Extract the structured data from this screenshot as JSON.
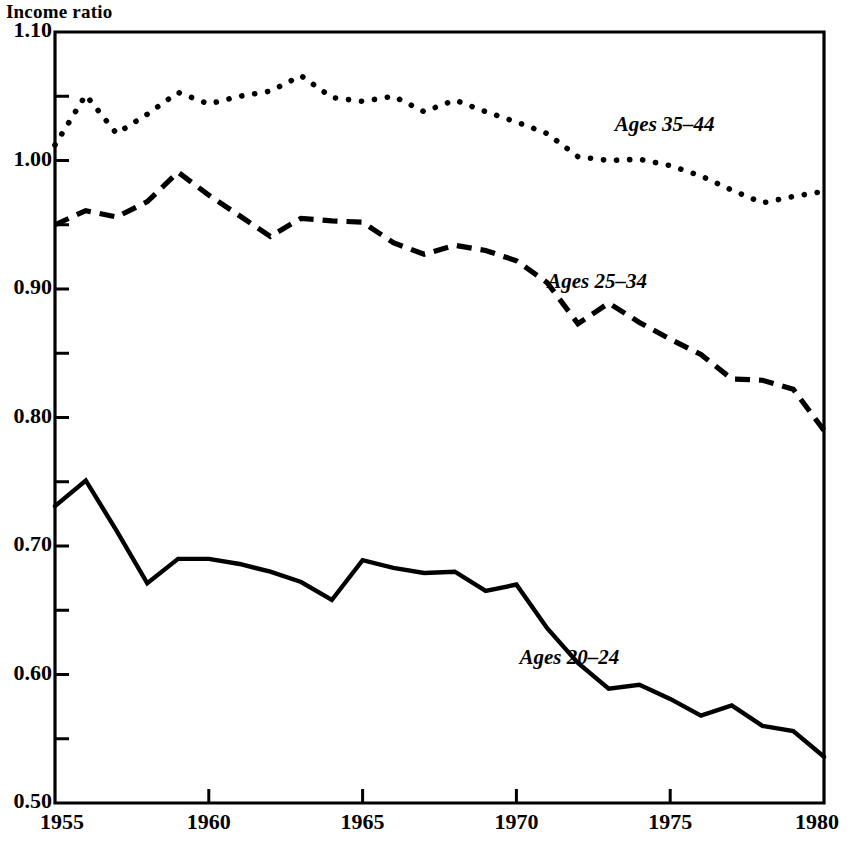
{
  "chart_data": {
    "type": "line",
    "title": "",
    "ylabel": "Income ratio",
    "xlabel": "",
    "xlim": [
      1955,
      1980
    ],
    "ylim": [
      0.5,
      1.1
    ],
    "grid": false,
    "legend_position": "inline-annotations",
    "y_ticks_major": [
      "0.50",
      "0.60",
      "0.70",
      "0.80",
      "0.90",
      "1.00",
      "1.10"
    ],
    "y_tick_values_major": [
      0.5,
      0.6,
      0.7,
      0.8,
      0.9,
      1.0,
      1.1
    ],
    "y_tick_values_minor": [
      0.55,
      0.65,
      0.75,
      0.85,
      0.95,
      1.05
    ],
    "x_ticks": [
      "1955",
      "1960",
      "1965",
      "1970",
      "1975",
      "1980"
    ],
    "x_tick_values": [
      1955,
      1960,
      1965,
      1970,
      1975,
      1980
    ],
    "x": [
      1955,
      1956,
      1957,
      1958,
      1959,
      1960,
      1961,
      1962,
      1963,
      1964,
      1965,
      1966,
      1967,
      1968,
      1969,
      1970,
      1971,
      1972,
      1973,
      1974,
      1975,
      1976,
      1977,
      1978,
      1979,
      1980
    ],
    "series": [
      {
        "name": "Ages 35-44",
        "label": "Ages 35–44",
        "style": "dotted",
        "color": "#000000",
        "label_x": 1973.2,
        "label_y": 1.027,
        "values": [
          1.012,
          1.051,
          1.021,
          1.036,
          1.053,
          1.044,
          1.05,
          1.054,
          1.066,
          1.049,
          1.046,
          1.05,
          1.038,
          1.047,
          1.038,
          1.03,
          1.021,
          1.003,
          1.0,
          1.001,
          0.996,
          0.988,
          0.977,
          0.967,
          0.972,
          0.976
        ]
      },
      {
        "name": "Ages 25-34",
        "label": "Ages 25–34",
        "style": "dashed",
        "color": "#000000",
        "label_x": 1971.0,
        "label_y": 0.905,
        "values": [
          0.95,
          0.961,
          0.956,
          0.968,
          0.991,
          0.973,
          0.957,
          0.941,
          0.955,
          0.953,
          0.952,
          0.936,
          0.927,
          0.934,
          0.93,
          0.922,
          0.905,
          0.873,
          0.889,
          0.874,
          0.861,
          0.849,
          0.83,
          0.829,
          0.822,
          0.79
        ]
      },
      {
        "name": "Ages 20-24",
        "label": "Ages 20–24",
        "style": "solid",
        "color": "#000000",
        "label_x": 1970.1,
        "label_y": 0.612,
        "values": [
          0.731,
          0.751,
          0.712,
          0.671,
          0.69,
          0.69,
          0.686,
          0.68,
          0.672,
          0.658,
          0.689,
          0.683,
          0.679,
          0.68,
          0.665,
          0.67,
          0.636,
          0.609,
          0.589,
          0.592,
          0.581,
          0.568,
          0.576,
          0.56,
          0.556,
          0.536
        ]
      }
    ]
  }
}
